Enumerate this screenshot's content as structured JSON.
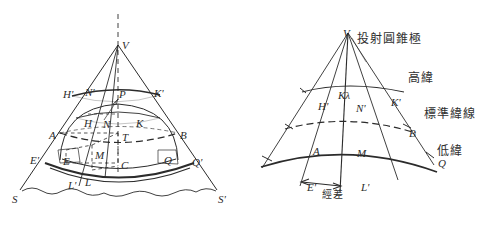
{
  "figure": {
    "title_visible": false,
    "background_color": "#ffffff",
    "ink_color": "#2b2b2b",
    "panels": [
      {
        "id": "left-panel",
        "name": "cone-tangent-to-globe-perspective",
        "apex_label": "V",
        "point_labels": [
          {
            "text": "V",
            "x": 122,
            "y": 40
          },
          {
            "text": "H'",
            "x": 63,
            "y": 89
          },
          {
            "text": "N'",
            "x": 85,
            "y": 87
          },
          {
            "text": "P",
            "x": 119,
            "y": 89
          },
          {
            "text": "K'",
            "x": 154,
            "y": 88
          },
          {
            "text": "H",
            "x": 84,
            "y": 118
          },
          {
            "text": "N",
            "x": 103,
            "y": 119
          },
          {
            "text": "K",
            "x": 136,
            "y": 118
          },
          {
            "text": "A",
            "x": 49,
            "y": 130
          },
          {
            "text": "B",
            "x": 180,
            "y": 130
          },
          {
            "text": "T",
            "x": 122,
            "y": 132
          },
          {
            "text": "M",
            "x": 95,
            "y": 150
          },
          {
            "text": "C",
            "x": 121,
            "y": 160
          },
          {
            "text": "E",
            "x": 63,
            "y": 156
          },
          {
            "text": "E'",
            "x": 30,
            "y": 155
          },
          {
            "text": "Q",
            "x": 164,
            "y": 155
          },
          {
            "text": "Q'",
            "x": 192,
            "y": 157
          },
          {
            "text": "L",
            "x": 85,
            "y": 177
          },
          {
            "text": "L'",
            "x": 68,
            "y": 180
          },
          {
            "text": "S",
            "x": 12,
            "y": 194
          },
          {
            "text": "S'",
            "x": 218,
            "y": 194
          }
        ]
      },
      {
        "id": "right-panel",
        "name": "developed-conic-projection-plane",
        "apex_label": "V",
        "point_labels": [
          {
            "text": "V",
            "x": 343,
            "y": 28
          },
          {
            "text": "Kλ",
            "x": 338,
            "y": 90
          },
          {
            "text": "H'",
            "x": 318,
            "y": 101
          },
          {
            "text": "N'",
            "x": 356,
            "y": 103
          },
          {
            "text": "K'",
            "x": 391,
            "y": 97
          },
          {
            "text": "B",
            "x": 409,
            "y": 128
          },
          {
            "text": "A",
            "x": 313,
            "y": 146
          },
          {
            "text": "M",
            "x": 357,
            "y": 148
          },
          {
            "text": "Q",
            "x": 438,
            "y": 158
          },
          {
            "text": "E'",
            "x": 307,
            "y": 182
          },
          {
            "text": "L'",
            "x": 361,
            "y": 182
          }
        ],
        "annotations": [
          {
            "text": "投射圓錐極",
            "x": 357,
            "y": 33,
            "name": "projection-cone-pole-label"
          },
          {
            "text": "高緯",
            "x": 408,
            "y": 72,
            "name": "high-latitude-label"
          },
          {
            "text": "標準緯線",
            "x": 424,
            "y": 108,
            "name": "standard-parallel-label"
          },
          {
            "text": "低緯",
            "x": 437,
            "y": 145,
            "name": "low-latitude-label"
          },
          {
            "text": "經差",
            "x": 322,
            "y": 190,
            "name": "longitude-difference-label"
          }
        ]
      }
    ]
  }
}
